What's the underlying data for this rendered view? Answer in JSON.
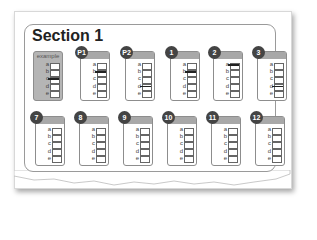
{
  "title": "Section 1",
  "options": [
    "a",
    "b",
    "c",
    "d",
    "e"
  ],
  "row1": [
    {
      "id": "example",
      "label": "example",
      "badge": "",
      "marked": "c",
      "x": 33,
      "y": 51
    },
    {
      "id": "p1",
      "label": "",
      "badge": "P1",
      "marked": "b",
      "x": 80,
      "y": 51
    },
    {
      "id": "p2",
      "label": "",
      "badge": "P2",
      "marked": "d",
      "x": 125,
      "y": 51
    },
    {
      "id": "q1",
      "label": "",
      "badge": "1",
      "marked": "b",
      "x": 170,
      "y": 51
    },
    {
      "id": "q2",
      "label": "",
      "badge": "2",
      "marked": "a",
      "x": 213,
      "y": 51
    },
    {
      "id": "q3",
      "label": "",
      "badge": "3",
      "marked": "d",
      "x": 257,
      "y": 51
    }
  ],
  "row2": [
    {
      "id": "q7",
      "label": "",
      "badge": "7",
      "marked": "",
      "x": 35,
      "y": 116
    },
    {
      "id": "q8",
      "label": "",
      "badge": "8",
      "marked": "",
      "x": 79,
      "y": 116
    },
    {
      "id": "q9",
      "label": "",
      "badge": "9",
      "marked": "",
      "x": 123,
      "y": 116
    },
    {
      "id": "q10",
      "label": "",
      "badge": "10",
      "marked": "",
      "x": 167,
      "y": 116
    },
    {
      "id": "q11",
      "label": "",
      "badge": "11",
      "marked": "",
      "x": 211,
      "y": 116
    },
    {
      "id": "q12",
      "label": "",
      "badge": "12",
      "marked": "",
      "x": 255,
      "y": 116
    }
  ],
  "colors": {
    "badge": "#444444",
    "header": "#a8a8a8",
    "border": "#8d8d8d",
    "example_fill": "#b5b5b5"
  }
}
